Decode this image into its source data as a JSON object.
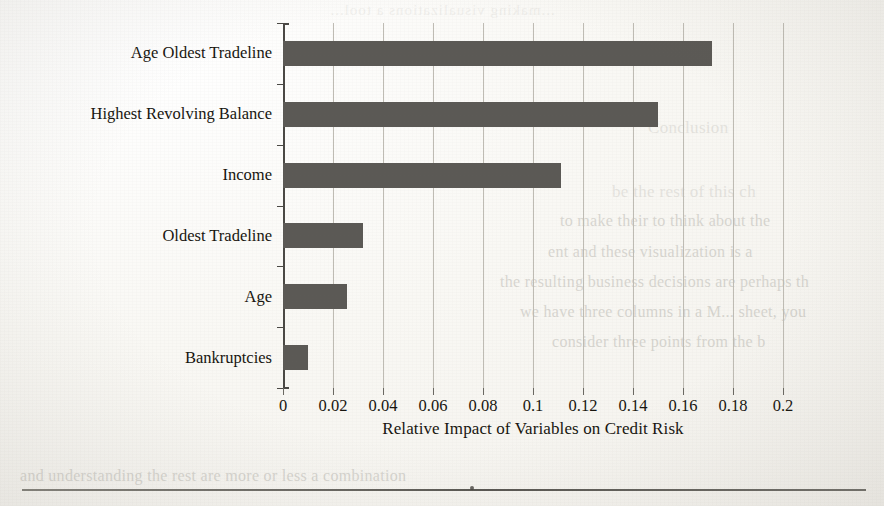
{
  "document": {
    "kind": "scanned-book-page",
    "figure_caption_axis": "Relative Impact of Variables on Credit Risk",
    "bottom_rule": "",
    "colors": {
      "bar_fill": "#5b5955",
      "gridline": "#bfbcb4",
      "axis": "#4a4844",
      "text": "#17150f",
      "paper": "#fbfaf7",
      "ghost_text": "#8d8a82"
    }
  },
  "ghost_text": {
    "top_mirrored": "...making visualizations a tool...",
    "lines": [
      {
        "text": "Conclusion",
        "x": 648,
        "y": 118,
        "size": 17,
        "mirrored": false,
        "strong": true
      },
      {
        "text": "be the rest of this ch",
        "x": 612,
        "y": 182,
        "size": 17,
        "mirrored": false,
        "strong": true
      },
      {
        "text": "to make their to think about the",
        "x": 560,
        "y": 212,
        "size": 16,
        "mirrored": false,
        "strong": false
      },
      {
        "text": "ent and these visualization is a",
        "x": 548,
        "y": 243,
        "size": 16,
        "mirrored": false,
        "strong": false
      },
      {
        "text": "the resulting business decisions are perhaps th",
        "x": 500,
        "y": 273,
        "size": 16,
        "mirrored": false,
        "strong": false
      },
      {
        "text": "we have three columns in a M... sheet, you",
        "x": 520,
        "y": 303,
        "size": 16,
        "mirrored": false,
        "strong": false
      },
      {
        "text": "consider three points from the b",
        "x": 552,
        "y": 333,
        "size": 16,
        "mirrored": false,
        "strong": false
      },
      {
        "text": "and understanding the rest are more or less a combination",
        "x": 20,
        "y": 467,
        "size": 16,
        "mirrored": false,
        "strong": false
      }
    ]
  },
  "chart_data": {
    "type": "bar",
    "orientation": "horizontal",
    "title": "",
    "xlabel": "Relative Impact of Variables on Credit Risk",
    "ylabel": "",
    "categories": [
      "Age Oldest Tradeline",
      "Highest Revolving Balance",
      "Income",
      "Oldest Tradeline",
      "Age",
      "Bankruptcies"
    ],
    "values": [
      0.1715,
      0.15,
      0.111,
      0.032,
      0.0255,
      0.01
    ],
    "xlim": [
      0,
      0.2
    ],
    "xticks": [
      0,
      0.02,
      0.04,
      0.06,
      0.08,
      0.1,
      0.12,
      0.14,
      0.16,
      0.18,
      0.2
    ],
    "xticklabels": [
      "0",
      "0.02",
      "0.04",
      "0.06",
      "0.08",
      "0.1",
      "0.12",
      "0.14",
      "0.16",
      "0.18",
      "0.2"
    ],
    "grid": "vertical",
    "legend": null,
    "bar_color": "#5b5955"
  }
}
